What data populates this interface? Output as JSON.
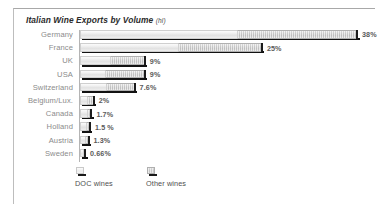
{
  "chart_data": {
    "type": "bar",
    "title": "Italian Wine Exports by Volume",
    "title_unit": "(hl)",
    "orientation": "horizontal",
    "xlabel": "",
    "ylabel": "",
    "grid": false,
    "legend_position": "bottom-left",
    "categories": [
      "Germany",
      "France",
      "UK",
      "USA",
      "Switzerland",
      "Belgium/Lux.",
      "Canada",
      "Holland",
      "Austria",
      "Sweden"
    ],
    "value_labels": [
      "38%",
      "25%",
      "9%",
      "9%",
      "7.6%",
      "2%",
      "1.7%",
      "1.5 %",
      "1.3%",
      "0.66%"
    ],
    "values": [
      38,
      25,
      9,
      9,
      7.6,
      2,
      1.7,
      1.5,
      1.3,
      0.66
    ],
    "xlim": [
      0,
      38
    ],
    "series": [
      {
        "name": "DOC wines",
        "values": [
          21.5,
          13.4,
          4.1,
          3.4,
          3.6,
          1.0,
          0.9,
          0.8,
          0.7,
          0.5
        ]
      },
      {
        "name": "Other wines",
        "values": [
          16.5,
          11.6,
          4.9,
          5.6,
          4.0,
          1.0,
          0.8,
          0.7,
          0.6,
          0.16
        ]
      }
    ],
    "legend": [
      {
        "label": "DOC wines",
        "swatch": "doc",
        "color": "#eeeeee"
      },
      {
        "label": "Other wines",
        "swatch": "other",
        "color": "#d2d2d2"
      }
    ],
    "colors": {
      "doc_wines": "#eeeeee",
      "other_wines": "#d2d2d2",
      "bar_shadow": "#121212",
      "label_text": "#8b8b8b",
      "value_text": "#5a5a5a",
      "axis": "#b4b4b4",
      "frame_border": "#a8a8a8",
      "background": "#ffffff"
    }
  }
}
